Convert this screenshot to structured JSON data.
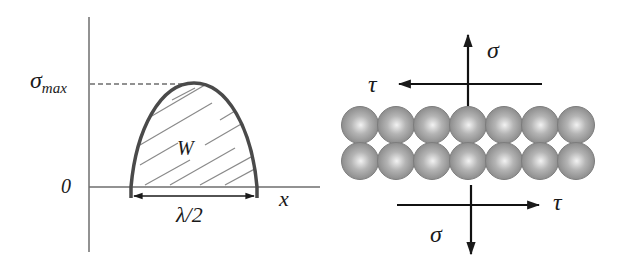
{
  "left_panel": {
    "y_labels": {
      "sigma_max": "σ",
      "sigma_max_sub": "max",
      "zero": "0"
    },
    "x_label": "x",
    "area_label": "W",
    "width_label": "λ/2"
  },
  "right_panel": {
    "top_normal_label": "σ",
    "top_shear_label": "τ",
    "bottom_normal_label": "σ",
    "bottom_shear_label": "τ",
    "atom_rows": 2,
    "atoms_per_row": 7
  },
  "colors": {
    "axis": "#6e6e6e",
    "curve": "#4a4a4a",
    "hatch": "#8a8a8a",
    "arrow": "#111111",
    "atom_light": "#e8e8e8",
    "atom_dark": "#7a7a7a"
  }
}
